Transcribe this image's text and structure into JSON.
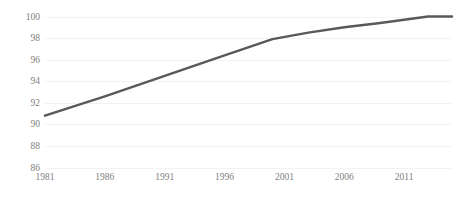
{
  "chart_data": {
    "type": "line",
    "title": "",
    "subtitle": "",
    "xlabel": "",
    "ylabel": "",
    "xlim": [
      1981,
      2015
    ],
    "ylim": [
      86,
      100
    ],
    "grid": true,
    "legend": false,
    "legend_position": "none",
    "line_color": "#595959",
    "gridline_color": "#f2f2f2",
    "tick_label_color": "#808080",
    "background_color": "#ffffff",
    "ytick_labels": [
      "86",
      "88",
      "90",
      "92",
      "94",
      "96",
      "98",
      "100"
    ],
    "ytick_values": [
      86,
      88,
      90,
      92,
      94,
      96,
      98,
      100
    ],
    "xtick_labels": [
      "1981",
      "1986",
      "1991",
      "1996",
      "2001",
      "2006",
      "2011"
    ],
    "xtick_values": [
      1981,
      1986,
      1991,
      1996,
      2001,
      2006,
      2011
    ],
    "series": [
      {
        "name": "",
        "x": [
          1981,
          1986,
          1991,
          1996,
          2000,
          2003,
          2006,
          2009,
          2011,
          2013,
          2015
        ],
        "values": [
          90.8,
          92.6,
          94.5,
          96.4,
          97.9,
          98.5,
          99.0,
          99.4,
          99.7,
          100.0,
          100.0
        ]
      }
    ]
  }
}
